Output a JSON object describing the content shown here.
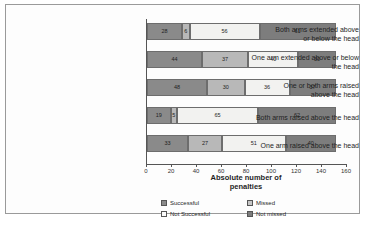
{
  "chart_data": {
    "type": "bar",
    "orientation": "horizontal",
    "stacked": true,
    "title": "",
    "xlabel": "Absolute number of penalties",
    "ylabel": "",
    "xlim": [
      0,
      160
    ],
    "xticks": [
      0,
      20,
      40,
      60,
      80,
      100,
      120,
      140,
      160
    ],
    "grid": false,
    "legend_position": "bottom",
    "categories": [
      "Both arms extended above or below the head",
      "One arm extended above or below the head",
      "One or both arms raised above the head",
      "Both arms raised above the head",
      "One arm raised above the head"
    ],
    "series": [
      {
        "name": "Successful",
        "color": "#8a8a8a",
        "values": [
          28,
          44,
          48,
          19,
          33
        ]
      },
      {
        "name": "Missed",
        "color": "#b8b8b8",
        "values": [
          6,
          37,
          30,
          5,
          27
        ]
      },
      {
        "name": "Not Successful",
        "color": "#f2f2f0",
        "values": [
          56,
          40,
          36,
          65,
          51
        ]
      },
      {
        "name": "Not missed",
        "color": "#7d7d7d",
        "values": [
          61,
          30,
          37,
          62,
          40
        ]
      }
    ],
    "row_totals": [
      151,
      151,
      151,
      151,
      151
    ]
  },
  "axis": {
    "x_title_line1": "Absolute number of",
    "x_title_line2": "penalties",
    "ticks": [
      "0",
      "20",
      "40",
      "60",
      "80",
      "100",
      "120",
      "140",
      "160"
    ]
  },
  "categories_wrapped": [
    {
      "line1": "Both arms extended above",
      "line2": "or below the head"
    },
    {
      "line1": "One arm extended above or below",
      "line2": "the head"
    },
    {
      "line1": "One or both arms raised",
      "line2": "above the head"
    },
    {
      "line1": "Both arms raised above the head",
      "line2": ""
    },
    {
      "line1": "One arm raised above the head",
      "line2": ""
    }
  ],
  "legend": {
    "items": [
      {
        "label": "Successful",
        "swatch": "sw0"
      },
      {
        "label": "Missed",
        "swatch": "sw1"
      },
      {
        "label": "Not Successful",
        "swatch": "sw2"
      },
      {
        "label": "Not missed",
        "swatch": "sw3"
      }
    ]
  }
}
